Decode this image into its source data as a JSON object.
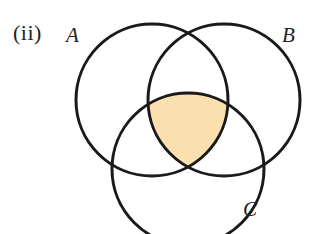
{
  "figure": {
    "part_label": "(ii)",
    "background_color": "#ffffff",
    "stroke_color": "#1a1a1a",
    "stroke_width": 3,
    "shaded_fill_color": "#fadfaf",
    "width": 312,
    "height": 234
  },
  "sets": [
    {
      "id": "A",
      "label": "A",
      "cx": 152,
      "cy": 100,
      "r": 76
    },
    {
      "id": "B",
      "label": "B",
      "cx": 224,
      "cy": 100,
      "r": 76
    },
    {
      "id": "C",
      "label": "C",
      "cx": 188,
      "cy": 169,
      "r": 76
    }
  ],
  "shaded_region": {
    "description": "A intersect B intersect C",
    "fill": "#fadfaf"
  }
}
